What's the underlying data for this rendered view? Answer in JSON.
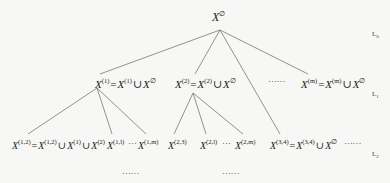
{
  "diagram": {
    "type": "tree",
    "root": {
      "base": "X",
      "sup": "∅"
    },
    "levels": [
      {
        "label": "L",
        "sub": "0"
      },
      {
        "label": "L",
        "sub": "1"
      },
      {
        "label": "L",
        "sub": "2"
      }
    ],
    "level1": [
      {
        "lhs_sup": "(1)",
        "rhs1_sup": "(1)",
        "rhs2_sup": "∅"
      },
      {
        "lhs_sup": "(2)",
        "rhs1_sup": "(2)",
        "rhs2_sup": "∅"
      },
      {
        "lhs_sup": "(m)",
        "rhs1_sup": "(m)",
        "rhs2_sup": "∅"
      }
    ],
    "level1_ellipsis": "……",
    "level2": {
      "n12": {
        "lhs_sup": "(1,2)",
        "rhs1_sup": "(1,2)",
        "rhs2_sup": "(1)",
        "rhs3_sup": "(2)"
      },
      "n1l": {
        "sup": "(1,l)"
      },
      "n1m": {
        "sup": "(1,m)"
      },
      "n23": {
        "sup": "(2,3)"
      },
      "n2l": {
        "sup": "(2,l)"
      },
      "n2m": {
        "sup": "(2,m)"
      },
      "n34": {
        "lhs_sup": "(3,4)",
        "rhs1_sup": "(3,4)",
        "rhs2_sup": "∅"
      },
      "mid_ellipsis": "…",
      "tail_ellipsis": "……"
    },
    "bottom_ellipsis": [
      "……",
      "……"
    ],
    "symbols": {
      "var": "X",
      "eq": "=",
      "union": "∪"
    }
  }
}
